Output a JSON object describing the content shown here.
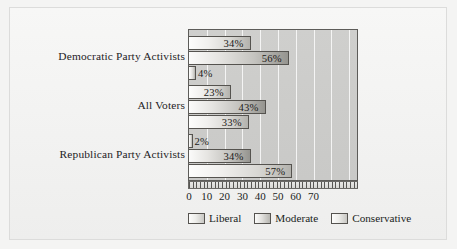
{
  "chart_data": {
    "type": "bar",
    "orientation": "horizontal",
    "title": "",
    "subtitle": "",
    "xlabel": "",
    "ylabel": "",
    "categories": [
      "Democratic Party Activists",
      "All Voters",
      "Republican Party Activists"
    ],
    "series": [
      {
        "name": "Liberal",
        "values": [
          34,
          23,
          2
        ]
      },
      {
        "name": "Moderate",
        "values": [
          56,
          43,
          34
        ]
      },
      {
        "name": "Conservative",
        "values": [
          4,
          33,
          57
        ]
      }
    ],
    "value_labels": [
      [
        "34%",
        "56%",
        "4%"
      ],
      [
        "23%",
        "43%",
        "33%"
      ],
      [
        "2%",
        "34%",
        "57%"
      ]
    ],
    "xlim": [
      0,
      93
    ],
    "xticks": [
      0,
      10,
      20,
      30,
      40,
      50,
      60,
      70
    ],
    "xtick_labels": [
      "0",
      "10",
      "20",
      "30",
      "40",
      "50",
      "60",
      "70"
    ],
    "grid": true,
    "grid_axis": "x",
    "legend": [
      "Liberal",
      "Moderate",
      "Conservative"
    ],
    "legend_position": "bottom",
    "colors": {
      "plot_background": "#cbcbc9",
      "figure_background": "#f2f2f1",
      "bar_light": "#f0efed",
      "bar_dark": "#b3b2ad",
      "axis_line": "#5d5c59",
      "gridline": "#ffffff",
      "text": "#201e1c"
    }
  }
}
